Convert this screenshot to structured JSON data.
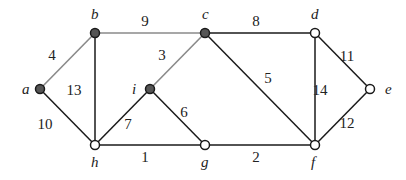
{
  "diagram": {
    "type": "weighted-undirected-graph",
    "colors": {
      "tree_edge": "#8a8a8a",
      "normal_edge": "#1a1a1a",
      "filled_node": "#555555",
      "open_node": "#ffffff",
      "node_stroke": "#1a1a1a"
    },
    "nodes": [
      {
        "id": "a",
        "label": "a",
        "x": 40,
        "y": 89,
        "filled": true,
        "lx": 22,
        "ly": 94
      },
      {
        "id": "b",
        "label": "b",
        "x": 95,
        "y": 33,
        "filled": true,
        "lx": 91,
        "ly": 19
      },
      {
        "id": "c",
        "label": "c",
        "x": 205,
        "y": 33,
        "filled": true,
        "lx": 202,
        "ly": 19
      },
      {
        "id": "d",
        "label": "d",
        "x": 315,
        "y": 33,
        "filled": false,
        "lx": 311,
        "ly": 19
      },
      {
        "id": "e",
        "label": "e",
        "x": 370,
        "y": 89,
        "filled": false,
        "lx": 385,
        "ly": 94
      },
      {
        "id": "f",
        "label": "f",
        "x": 315,
        "y": 145,
        "filled": false,
        "lx": 311,
        "ly": 167
      },
      {
        "id": "g",
        "label": "g",
        "x": 205,
        "y": 145,
        "filled": false,
        "lx": 201,
        "ly": 167
      },
      {
        "id": "h",
        "label": "h",
        "x": 95,
        "y": 145,
        "filled": false,
        "lx": 91,
        "ly": 167
      },
      {
        "id": "i",
        "label": "i",
        "x": 150,
        "y": 89,
        "filled": true,
        "lx": 132,
        "ly": 94
      }
    ],
    "edges": [
      {
        "from": "a",
        "to": "b",
        "weight": "4",
        "tree": true,
        "lx": 52,
        "ly": 60
      },
      {
        "from": "b",
        "to": "c",
        "weight": "9",
        "tree": true,
        "lx": 145,
        "ly": 26
      },
      {
        "from": "c",
        "to": "i",
        "weight": "3",
        "tree": true,
        "lx": 162,
        "ly": 60
      },
      {
        "from": "a",
        "to": "h",
        "weight": "10",
        "tree": false,
        "lx": 45,
        "ly": 129
      },
      {
        "from": "b",
        "to": "h",
        "weight": "13",
        "tree": false,
        "lx": 74,
        "ly": 95
      },
      {
        "from": "i",
        "to": "h",
        "weight": "7",
        "tree": false,
        "lx": 128,
        "ly": 129
      },
      {
        "from": "i",
        "to": "g",
        "weight": "6",
        "tree": false,
        "lx": 184,
        "ly": 117
      },
      {
        "from": "h",
        "to": "g",
        "weight": "1",
        "tree": false,
        "lx": 145,
        "ly": 162
      },
      {
        "from": "g",
        "to": "f",
        "weight": "2",
        "tree": false,
        "lx": 256,
        "ly": 162
      },
      {
        "from": "c",
        "to": "d",
        "weight": "8",
        "tree": false,
        "lx": 256,
        "ly": 26
      },
      {
        "from": "c",
        "to": "f",
        "weight": "5",
        "tree": false,
        "lx": 268,
        "ly": 83
      },
      {
        "from": "d",
        "to": "f",
        "weight": "14",
        "tree": false,
        "lx": 320,
        "ly": 95
      },
      {
        "from": "d",
        "to": "e",
        "weight": "11",
        "tree": false,
        "lx": 347,
        "ly": 61
      },
      {
        "from": "f",
        "to": "e",
        "weight": "12",
        "tree": false,
        "lx": 347,
        "ly": 128
      }
    ]
  }
}
